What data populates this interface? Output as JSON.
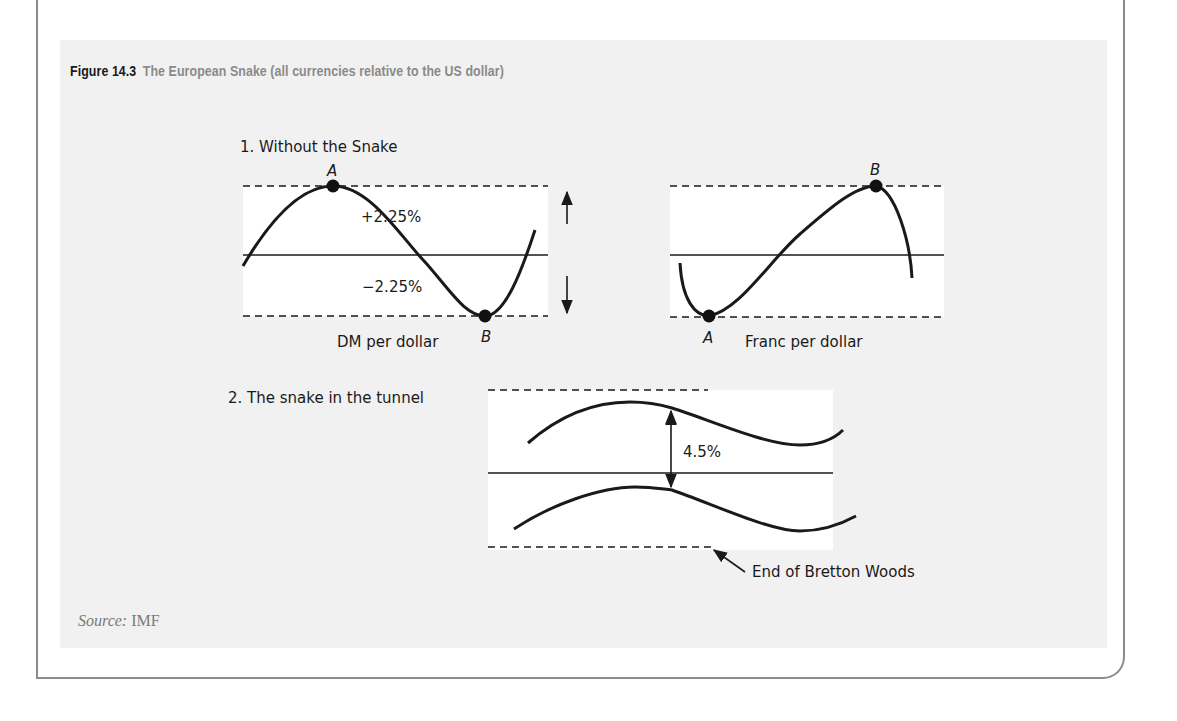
{
  "figure": {
    "number": "Figure 14.3",
    "caption": "The European Snake (all currencies relative to the US dollar)",
    "source_label": "Source:",
    "source_value": "IMF"
  },
  "panel1": {
    "title": "1. Without the Snake",
    "upper_band_label": "+2.25%",
    "lower_band_label": "−2.25%",
    "left_chart": {
      "label": "DM per dollar",
      "point_high": "A",
      "point_low": "B"
    },
    "right_chart": {
      "label": "Franc per dollar",
      "point_high": "B",
      "point_low": "A"
    }
  },
  "panel2": {
    "title": "2. The snake in the tunnel",
    "band_width_label": "4.5%",
    "annotation": "End of Bretton Woods"
  },
  "colors": {
    "panel_bg": "#f1f1f1",
    "plot_bg": "#ffffff",
    "line": "#1a1a1a",
    "caption_gray": "#8a8a8a",
    "frame": "#8c8c8c"
  }
}
